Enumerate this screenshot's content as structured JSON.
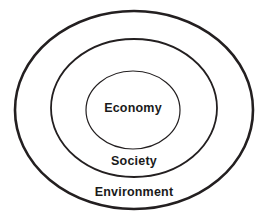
{
  "diagram": {
    "type": "nested-ellipses",
    "background_color": "#ffffff",
    "stroke_color": "#231f20",
    "text_color": "#1a1a1a",
    "title": "",
    "rings": [
      {
        "id": "environment",
        "label": "Environment",
        "level": 1,
        "position": "outermost",
        "cx": 134,
        "cy": 110,
        "rx": 119,
        "ry": 99,
        "stroke_width": 2.6,
        "label_x": 134,
        "label_y": 192
      },
      {
        "id": "society",
        "label": "Society",
        "level": 2,
        "position": "middle",
        "cx": 134,
        "cy": 108,
        "rx": 83,
        "ry": 69,
        "stroke_width": 1.8,
        "label_x": 134,
        "label_y": 161
      },
      {
        "id": "economy",
        "label": "Economy",
        "level": 3,
        "position": "innermost",
        "cx": 133,
        "cy": 110,
        "rx": 47,
        "ry": 39,
        "stroke_width": 1.2,
        "label_x": 133,
        "label_y": 108
      }
    ]
  }
}
